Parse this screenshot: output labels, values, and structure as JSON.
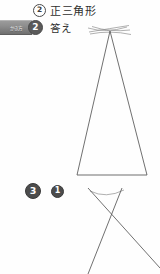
{
  "page": {
    "width": 160,
    "height": 274,
    "background": "#fefefe",
    "language": "ja"
  },
  "problem_2": {
    "marker": "2",
    "title": "正三角形",
    "answer_badge": "かき方",
    "answer_marker": "2",
    "answer_label": "答え"
  },
  "problem_3": {
    "marker": "3",
    "sub_marker": "1"
  },
  "figures": {
    "triangle": {
      "name": "equilateral-triangle-construction",
      "apex": [
        110,
        31
      ],
      "base_left": [
        77,
        175
      ],
      "base_right": [
        147,
        175
      ],
      "has_construction_arcs": true,
      "arc_count": 4
    },
    "crossed_lines": {
      "name": "angle-construction-lines",
      "intersection": [
        105,
        196
      ],
      "line_a": [
        [
          88,
          188
        ],
        [
          160,
          268
        ]
      ],
      "line_b": [
        [
          122,
          188
        ],
        [
          88,
          274
        ]
      ],
      "has_construction_arcs": true
    }
  },
  "colors": {
    "ink": "#2f2f2f",
    "line": "#565656",
    "arc": "#8e8e8e",
    "marker_fill": "#4c4c4c",
    "ribbon": "#8d8d8d"
  }
}
